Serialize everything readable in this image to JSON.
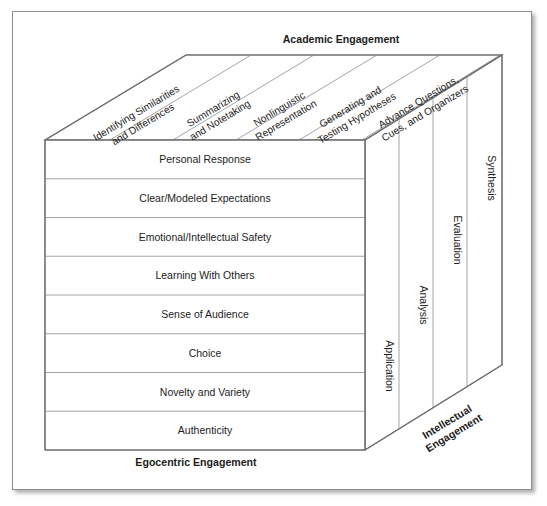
{
  "diagram": {
    "title_top": "Academic Engagement",
    "title_bottom": "Egocentric Engagement",
    "title_right_line1": "Intellectual",
    "title_right_line2": "Engagement",
    "front_rows": [
      "Personal Response",
      "Clear/Modeled Expectations",
      "Emotional/Intellectual Safety",
      "Learning With Others",
      "Sense of Audience",
      "Choice",
      "Novelty and Variety",
      "Authenticity"
    ],
    "top_columns": [
      {
        "line1": "Identifying Similarities",
        "line2": "and Differences"
      },
      {
        "line1": "Summarizing",
        "line2": "and Notetaking"
      },
      {
        "line1": "Nonlinguistic",
        "line2": "Representation"
      },
      {
        "line1": "Generating and",
        "line2": "Testing Hypotheses"
      },
      {
        "line1": "Advance Questions,",
        "line2": "Cues, and Organizers"
      }
    ],
    "side_panels": [
      "Application",
      "Analysis",
      "Evaluation",
      "Synthesis"
    ],
    "colors": {
      "line": "#6f6f6f",
      "thin_line": "#9a9a9a",
      "text": "#1d1d1d",
      "background": "#ffffff",
      "frame_border": "#8d8d8d"
    }
  }
}
